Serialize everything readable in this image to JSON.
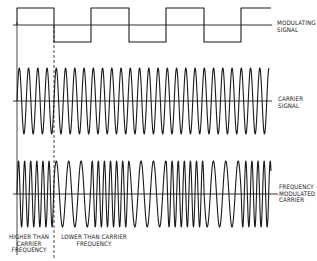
{
  "diagram": {
    "colors": {
      "ink": "#1a1a1a",
      "background": "#ffffff"
    },
    "labels": {
      "modulating": [
        "MODULATING",
        "SIGNAL"
      ],
      "carrier": [
        "CARRIER",
        "SIGNAL"
      ],
      "fm": [
        "FREQUENCY",
        "MODULATED",
        "CARRIER"
      ],
      "higher": [
        "HIGHER THAN",
        "CARRIER",
        "FREQUENCY"
      ],
      "lower": [
        "LOWER THAN CARRIER",
        "FREQUENCY"
      ]
    },
    "modulating_signal": {
      "axis_y": 25,
      "high_y": 8,
      "low_y": 42,
      "axis_x": [
        13,
        272
      ],
      "start_x": 17,
      "end_x": 271,
      "transitions_x": [
        54,
        91,
        129,
        166,
        204,
        241
      ],
      "initial_level": "high"
    },
    "carrier_signal": {
      "axis_y": 101,
      "amplitude": 33,
      "axis_x": [
        13,
        272
      ],
      "start_x": 17,
      "end_x": 269,
      "period": 9.25
    },
    "fm_carrier": {
      "axis_y": 194,
      "amplitude": 33,
      "axis_x": [
        13,
        278
      ],
      "start_x": 17,
      "end_x": 271,
      "high_period": 6.1,
      "low_period": 12.4
    },
    "dividers": {
      "solid": {
        "x": 17,
        "y": [
          22,
          255
        ]
      },
      "dashed": {
        "x": 54,
        "y": [
          25,
          258
        ]
      }
    }
  }
}
